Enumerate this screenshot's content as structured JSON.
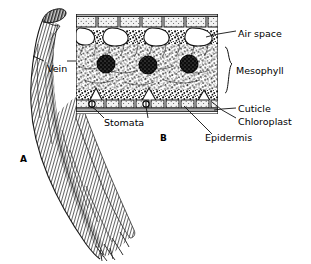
{
  "figure": {
    "background_color": "#ffffff",
    "ink_color": "#000000"
  },
  "panels": [
    {
      "id": "A",
      "name": "whole-leaf-drawing",
      "caption": "A",
      "description": "Narrow folded grass-like leaf blade with longitudinal parallel vein striations, tapering to a split tip",
      "x": 20,
      "y": 157
    },
    {
      "id": "B",
      "name": "leaf-cross-section",
      "caption": "B",
      "description": "Magnified cross section of leaf tissue showing epidermis, cuticle, mesophyll, air spaces, chloroplasts and stomata",
      "x": 160,
      "y": 137
    }
  ],
  "labels": [
    {
      "key": "vein",
      "text": "Vein",
      "panel": "A",
      "x": 47,
      "y": 64,
      "leader": "left-and-right"
    },
    {
      "key": "air_space",
      "text": "Air space",
      "panel": "B",
      "x": 238,
      "y": 29,
      "leader": "left"
    },
    {
      "key": "mesophyll",
      "text": "Mesophyll",
      "panel": "B",
      "x": 244,
      "y": 66,
      "leader": "brace"
    },
    {
      "key": "cuticle",
      "text": "Cuticle",
      "panel": "B",
      "x": 238,
      "y": 106,
      "leader": "left"
    },
    {
      "key": "chloroplast",
      "text": "Chloroplast",
      "panel": "B",
      "x": 238,
      "y": 119,
      "leader": "left"
    },
    {
      "key": "epidermis",
      "text": "Epidermis",
      "panel": "B",
      "x": 213,
      "y": 137,
      "leader": "up-left"
    },
    {
      "key": "stomata",
      "text": "Stomata",
      "panel": "B",
      "x": 104,
      "y": 120,
      "leader": "up-left-and-up-right"
    }
  ],
  "cross_section": {
    "bounds": {
      "x": 76,
      "y": 14,
      "width": 142,
      "height": 100
    },
    "air_space_count": 4,
    "chloroplast_count": 3,
    "stomata_count": 2,
    "chloroplast_color": "#1a1a1a",
    "air_space_color": "#ffffff"
  }
}
